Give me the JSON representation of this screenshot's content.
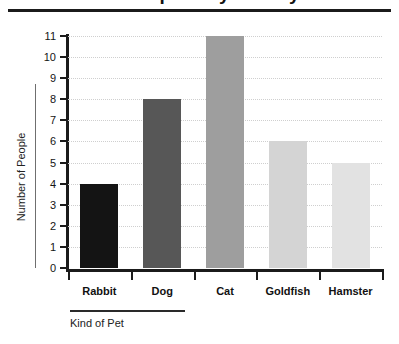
{
  "title": "Pet Popularity Survey",
  "chart_data": {
    "type": "bar",
    "title": "Pet Popularity Survey",
    "xlabel": "Kind of Pet",
    "ylabel": "Number of People",
    "categories": [
      "Rabbit",
      "Dog",
      "Cat",
      "Goldfish",
      "Hamster"
    ],
    "values": [
      4,
      8,
      11,
      6,
      5
    ],
    "bar_colors": [
      "#141414",
      "#575757",
      "#9e9e9e",
      "#d4d4d4",
      "#e2e2e2"
    ],
    "ylim": [
      0,
      11
    ],
    "ytick_labels": [
      "0",
      "1",
      "2",
      "3",
      "4",
      "5",
      "6",
      "7",
      "8",
      "9",
      "10",
      "11"
    ],
    "ytick_values": [
      0,
      1,
      2,
      3,
      4,
      5,
      6,
      7,
      8,
      9,
      10,
      11
    ],
    "grid": true,
    "grid_style": "dotted",
    "legend": "none",
    "axis_color": "#1b1b1b",
    "grid_color": "#cfcfcf"
  }
}
